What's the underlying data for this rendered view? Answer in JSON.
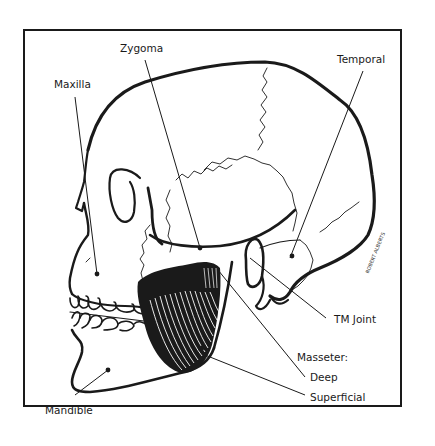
{
  "figure": {
    "labels": {
      "zygoma": "Zygoma",
      "maxilla": "Maxilla",
      "temporal": "Temporal",
      "tm_joint": "TM Joint",
      "masseter": "Masseter:",
      "deep": "Deep",
      "superficial": "Superficial",
      "mandible": "Mandible"
    },
    "signature": "ROBERT ALBERTS"
  },
  "colors": {
    "line": "#1a1a1a",
    "background": "#ffffff"
  }
}
